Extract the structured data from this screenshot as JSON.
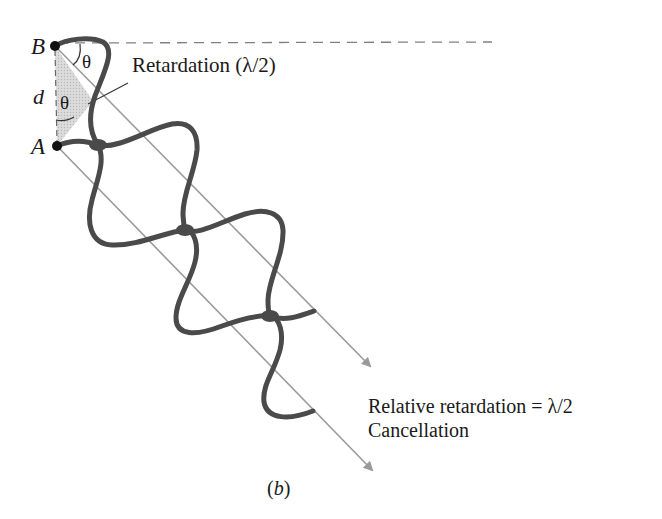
{
  "figure": {
    "caption": "(b)",
    "points": {
      "b_label": "B",
      "a_label": "A",
      "d_label": "d"
    },
    "angles": {
      "theta_top": "θ",
      "theta_mid": "θ"
    },
    "annotations": {
      "retardation": "Retardation (λ/2)",
      "relative_retardation": "Relative retardation = λ/2",
      "result": "Cancellation"
    },
    "colors": {
      "wave": "#4a4a4a",
      "ray": "#9a9a9a",
      "shade": "#d4d4d4",
      "dashed": "#808080",
      "point": "#111111"
    }
  }
}
